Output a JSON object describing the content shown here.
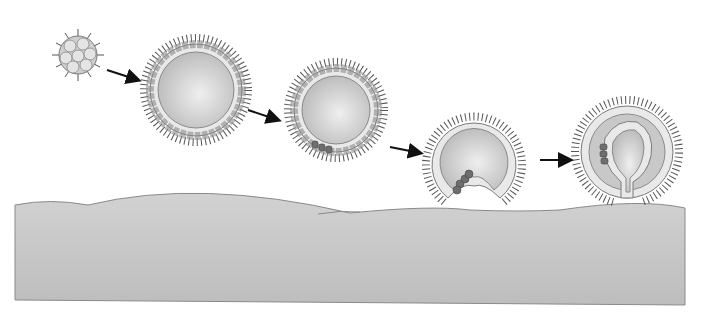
{
  "diagram": {
    "type": "embryo-development-sequence",
    "background": "#ffffff",
    "colors": {
      "substrate": "#c4c4c4",
      "substrate_edge": "#8a8a8a",
      "sphere_fill": "#cfcfcf",
      "sphere_highlight": "#ededed",
      "cell_fill": "#e9e9e9",
      "cell_stroke": "#7a7a7a",
      "dark_cell": "#6e6e6e",
      "cilia": "#555555",
      "arrow": "#111111"
    },
    "stages": [
      {
        "id": 1,
        "name": "morula",
        "cx": 78,
        "cy": 55,
        "r": 20
      },
      {
        "id": 2,
        "name": "blastula",
        "cx": 196,
        "cy": 90,
        "r": 46
      },
      {
        "id": 3,
        "name": "blastula-with-marked-cells",
        "cx": 336,
        "cy": 110,
        "r": 42
      },
      {
        "id": 4,
        "name": "early-invagination",
        "cx": 474,
        "cy": 162,
        "r": 42
      },
      {
        "id": 5,
        "name": "gastrula",
        "cx": 627,
        "cy": 152,
        "r": 46
      }
    ],
    "arrows": [
      {
        "from": 1,
        "to": 2
      },
      {
        "from": 2,
        "to": 3
      },
      {
        "from": 3,
        "to": 4
      },
      {
        "from": 4,
        "to": 5
      }
    ]
  }
}
